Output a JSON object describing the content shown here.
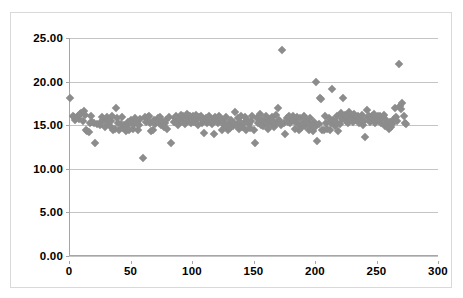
{
  "chart_data": {
    "type": "scatter",
    "title": "",
    "xlabel": "",
    "ylabel": "",
    "xlim": [
      0,
      300
    ],
    "ylim": [
      0,
      25
    ],
    "grid": true,
    "legend": false,
    "marker": {
      "shape": "diamond",
      "color": "#8c8c8c",
      "size_px": 6
    },
    "xticks": [
      0,
      50,
      100,
      150,
      200,
      250,
      300
    ],
    "xtick_labels": [
      "0",
      "50",
      "100",
      "150",
      "200",
      "250",
      "300"
    ],
    "yticks": [
      0,
      5,
      10,
      15,
      20,
      25
    ],
    "ytick_labels": [
      "0.00",
      "5.00",
      "10.00",
      "15.00",
      "20.00",
      "25.00"
    ],
    "series": [
      {
        "name": "series-1",
        "points": [
          [
            1,
            18.1
          ],
          [
            3,
            16.0
          ],
          [
            4,
            15.9
          ],
          [
            5,
            15.6
          ],
          [
            6,
            15.8
          ],
          [
            7,
            16.1
          ],
          [
            8,
            15.7
          ],
          [
            9,
            16.3
          ],
          [
            10,
            16.4
          ],
          [
            11,
            15.5
          ],
          [
            12,
            16.6
          ],
          [
            13,
            16.2
          ],
          [
            14,
            14.4
          ],
          [
            15,
            14.3
          ],
          [
            16,
            14.2
          ],
          [
            17,
            15.3
          ],
          [
            18,
            16.1
          ],
          [
            19,
            15.4
          ],
          [
            20,
            15.2
          ],
          [
            21,
            13.0
          ],
          [
            23,
            15.1
          ],
          [
            25,
            15.0
          ],
          [
            26,
            15.4
          ],
          [
            27,
            15.9
          ],
          [
            28,
            15.6
          ],
          [
            29,
            14.8
          ],
          [
            30,
            15.7
          ],
          [
            31,
            15.9
          ],
          [
            32,
            15.2
          ],
          [
            33,
            14.9
          ],
          [
            34,
            15.5
          ],
          [
            35,
            16.0
          ],
          [
            36,
            14.5
          ],
          [
            37,
            14.6
          ],
          [
            38,
            17.0
          ],
          [
            39,
            15.8
          ],
          [
            40,
            15.3
          ],
          [
            41,
            14.4
          ],
          [
            42,
            15.1
          ],
          [
            43,
            15.9
          ],
          [
            44,
            14.7
          ],
          [
            45,
            15.0
          ],
          [
            46,
            14.3
          ],
          [
            47,
            14.9
          ],
          [
            48,
            15.4
          ],
          [
            49,
            14.4
          ],
          [
            50,
            15.6
          ],
          [
            51,
            15.2
          ],
          [
            52,
            14.6
          ],
          [
            53,
            15.1
          ],
          [
            54,
            15.8
          ],
          [
            55,
            15.3
          ],
          [
            56,
            14.5
          ],
          [
            57,
            15.0
          ],
          [
            58,
            15.7
          ],
          [
            60,
            11.2
          ],
          [
            62,
            15.9
          ],
          [
            63,
            15.4
          ],
          [
            64,
            15.9
          ],
          [
            65,
            16.0
          ],
          [
            66,
            15.2
          ],
          [
            67,
            14.3
          ],
          [
            68,
            14.4
          ],
          [
            69,
            15.6
          ],
          [
            70,
            15.1
          ],
          [
            72,
            15.8
          ],
          [
            73,
            15.3
          ],
          [
            74,
            15.9
          ],
          [
            75,
            15.0
          ],
          [
            76,
            15.5
          ],
          [
            77,
            14.8
          ],
          [
            78,
            15.2
          ],
          [
            79,
            15.6
          ],
          [
            80,
            14.6
          ],
          [
            81,
            15.9
          ],
          [
            83,
            13.0
          ],
          [
            85,
            15.4
          ],
          [
            86,
            15.8
          ],
          [
            87,
            16.1
          ],
          [
            88,
            15.3
          ],
          [
            89,
            15.0
          ],
          [
            90,
            15.7
          ],
          [
            91,
            16.2
          ],
          [
            92,
            15.5
          ],
          [
            93,
            16.0
          ],
          [
            94,
            15.1
          ],
          [
            95,
            15.9
          ],
          [
            96,
            16.3
          ],
          [
            97,
            15.6
          ],
          [
            98,
            16.1
          ],
          [
            99,
            15.2
          ],
          [
            100,
            15.8
          ],
          [
            101,
            16.0
          ],
          [
            102,
            15.4
          ],
          [
            103,
            16.2
          ],
          [
            104,
            15.7
          ],
          [
            105,
            15.0
          ],
          [
            106,
            15.9
          ],
          [
            107,
            16.1
          ],
          [
            108,
            15.3
          ],
          [
            109,
            15.6
          ],
          [
            110,
            14.1
          ],
          [
            111,
            15.8
          ],
          [
            112,
            15.2
          ],
          [
            113,
            15.5
          ],
          [
            114,
            16.0
          ],
          [
            115,
            15.7
          ],
          [
            116,
            15.1
          ],
          [
            117,
            15.4
          ],
          [
            118,
            14.0
          ],
          [
            119,
            15.9
          ],
          [
            120,
            15.6
          ],
          [
            121,
            15.3
          ],
          [
            122,
            16.0
          ],
          [
            123,
            15.8
          ],
          [
            124,
            14.4
          ],
          [
            125,
            15.5
          ],
          [
            126,
            15.0
          ],
          [
            127,
            14.8
          ],
          [
            128,
            15.9
          ],
          [
            129,
            14.5
          ],
          [
            130,
            15.2
          ],
          [
            131,
            14.7
          ],
          [
            132,
            15.6
          ],
          [
            133,
            14.9
          ],
          [
            134,
            15.3
          ],
          [
            135,
            16.5
          ],
          [
            136,
            15.0
          ],
          [
            137,
            15.8
          ],
          [
            138,
            14.6
          ],
          [
            139,
            15.4
          ],
          [
            140,
            16.0
          ],
          [
            141,
            14.8
          ],
          [
            142,
            15.2
          ],
          [
            143,
            15.9
          ],
          [
            144,
            14.4
          ],
          [
            145,
            15.6
          ],
          [
            146,
            15.1
          ],
          [
            147,
            14.7
          ],
          [
            148,
            15.5
          ],
          [
            149,
            16.1
          ],
          [
            150,
            14.5
          ],
          [
            151,
            13.0
          ],
          [
            153,
            15.8
          ],
          [
            154,
            15.2
          ],
          [
            155,
            16.3
          ],
          [
            156,
            15.0
          ],
          [
            157,
            15.6
          ],
          [
            158,
            14.9
          ],
          [
            159,
            15.4
          ],
          [
            160,
            16.0
          ],
          [
            161,
            15.3
          ],
          [
            162,
            14.6
          ],
          [
            163,
            15.7
          ],
          [
            164,
            15.1
          ],
          [
            165,
            15.9
          ],
          [
            166,
            15.5
          ],
          [
            167,
            14.8
          ],
          [
            168,
            16.2
          ],
          [
            169,
            15.2
          ],
          [
            170,
            17.0
          ],
          [
            171,
            15.6
          ],
          [
            172,
            15.0
          ],
          [
            173,
            23.6
          ],
          [
            175,
            15.3
          ],
          [
            176,
            14.0
          ],
          [
            177,
            15.8
          ],
          [
            178,
            15.4
          ],
          [
            179,
            16.1
          ],
          [
            180,
            15.2
          ],
          [
            181,
            15.7
          ],
          [
            182,
            16.0
          ],
          [
            183,
            15.5
          ],
          [
            184,
            14.6
          ],
          [
            185,
            15.9
          ],
          [
            186,
            15.1
          ],
          [
            187,
            14.4
          ],
          [
            188,
            15.8
          ],
          [
            189,
            14.7
          ],
          [
            190,
            15.3
          ],
          [
            191,
            16.0
          ],
          [
            192,
            14.9
          ],
          [
            193,
            15.6
          ],
          [
            194,
            15.2
          ],
          [
            195,
            14.5
          ],
          [
            196,
            15.8
          ],
          [
            197,
            15.0
          ],
          [
            198,
            14.3
          ],
          [
            199,
            15.4
          ],
          [
            200,
            14.8
          ],
          [
            201,
            20.0
          ],
          [
            202,
            13.2
          ],
          [
            203,
            15.1
          ],
          [
            204,
            18.1
          ],
          [
            205,
            18.0
          ],
          [
            206,
            14.5
          ],
          [
            207,
            14.4
          ],
          [
            208,
            16.0
          ],
          [
            209,
            15.3
          ],
          [
            210,
            14.6
          ],
          [
            211,
            15.8
          ],
          [
            212,
            14.4
          ],
          [
            213,
            15.2
          ],
          [
            214,
            19.1
          ],
          [
            215,
            15.6
          ],
          [
            216,
            14.9
          ],
          [
            217,
            15.4
          ],
          [
            218,
            16.0
          ],
          [
            219,
            14.3
          ],
          [
            220,
            15.1
          ],
          [
            221,
            16.4
          ],
          [
            222,
            15.7
          ],
          [
            223,
            18.1
          ],
          [
            224,
            16.2
          ],
          [
            225,
            15.5
          ],
          [
            226,
            16.0
          ],
          [
            227,
            15.2
          ],
          [
            228,
            16.5
          ],
          [
            229,
            15.8
          ],
          [
            230,
            16.1
          ],
          [
            231,
            15.4
          ],
          [
            232,
            16.3
          ],
          [
            233,
            15.6
          ],
          [
            234,
            15.9
          ],
          [
            235,
            16.0
          ],
          [
            236,
            15.3
          ],
          [
            237,
            15.7
          ],
          [
            238,
            16.2
          ],
          [
            239,
            15.0
          ],
          [
            240,
            15.5
          ],
          [
            241,
            13.7
          ],
          [
            242,
            16.8
          ],
          [
            243,
            15.9
          ],
          [
            244,
            16.1
          ],
          [
            245,
            15.4
          ],
          [
            246,
            16.0
          ],
          [
            247,
            15.7
          ],
          [
            248,
            16.3
          ],
          [
            249,
            15.2
          ],
          [
            250,
            15.8
          ],
          [
            251,
            16.1
          ],
          [
            252,
            15.5
          ],
          [
            253,
            16.0
          ],
          [
            254,
            15.3
          ],
          [
            255,
            15.9
          ],
          [
            256,
            16.2
          ],
          [
            257,
            14.9
          ],
          [
            258,
            15.6
          ],
          [
            259,
            15.0
          ],
          [
            260,
            14.6
          ],
          [
            261,
            15.4
          ],
          [
            262,
            14.8
          ],
          [
            263,
            15.1
          ],
          [
            264,
            15.7
          ],
          [
            265,
            17.0
          ],
          [
            266,
            15.9
          ],
          [
            267,
            15.5
          ],
          [
            268,
            22.0
          ],
          [
            269,
            17.2
          ],
          [
            270,
            16.9
          ],
          [
            271,
            17.6
          ],
          [
            272,
            16.0
          ],
          [
            273,
            15.2
          ],
          [
            274,
            15.1
          ]
        ]
      }
    ]
  }
}
